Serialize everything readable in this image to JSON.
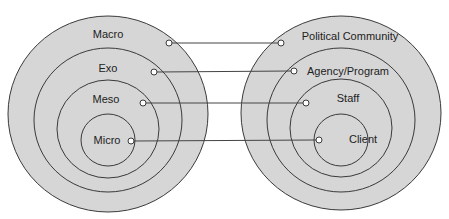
{
  "colors": {
    "fill": "#d6d6d6",
    "stroke": "#3a3a3a",
    "dot_fill": "#ffffff",
    "line": "#444444",
    "text": "#222222"
  },
  "left_model": {
    "levels": [
      {
        "label": "Macro",
        "cx": 108,
        "cy": 114,
        "rx": 100,
        "ry": 98,
        "label_x": 108,
        "label_y": 38,
        "dot_x": 169,
        "dot_y": 43
      },
      {
        "label": "Exo",
        "cx": 108,
        "cy": 120,
        "rx": 74,
        "ry": 72,
        "label_x": 108,
        "label_y": 72,
        "dot_x": 154,
        "dot_y": 72
      },
      {
        "label": "Meso",
        "cx": 108,
        "cy": 129,
        "rx": 51,
        "ry": 49,
        "label_x": 106,
        "label_y": 103,
        "dot_x": 143,
        "dot_y": 103
      },
      {
        "label": "Micro",
        "cx": 108,
        "cy": 140,
        "rx": 27,
        "ry": 26,
        "label_x": 107,
        "label_y": 144,
        "dot_x": 131,
        "dot_y": 141
      }
    ]
  },
  "right_model": {
    "levels": [
      {
        "label": "Political Community",
        "cx": 341,
        "cy": 113,
        "rx": 100,
        "ry": 97,
        "label_x": 350,
        "label_y": 40,
        "dot_x": 281,
        "dot_y": 43
      },
      {
        "label": "Agency/Program",
        "cx": 341,
        "cy": 120,
        "rx": 74,
        "ry": 72,
        "label_x": 348,
        "label_y": 75,
        "dot_x": 294,
        "dot_y": 71
      },
      {
        "label": "Staff",
        "cx": 341,
        "cy": 128,
        "rx": 51,
        "ry": 49,
        "label_x": 348,
        "label_y": 102,
        "dot_x": 306,
        "dot_y": 103
      },
      {
        "label": "Client",
        "cx": 341,
        "cy": 140,
        "rx": 27,
        "ry": 26,
        "label_x": 363,
        "label_y": 143,
        "dot_x": 319,
        "dot_y": 140
      }
    ]
  },
  "connections": [
    {
      "from": "Macro",
      "to": "Political Community"
    },
    {
      "from": "Exo",
      "to": "Agency/Program"
    },
    {
      "from": "Meso",
      "to": "Staff"
    },
    {
      "from": "Micro",
      "to": "Client"
    }
  ]
}
